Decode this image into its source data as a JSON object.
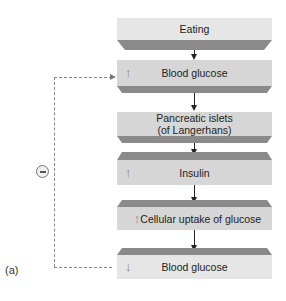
{
  "diagram": {
    "panel_label": "(a)",
    "feedback": {
      "sign": "−",
      "sign_icon": "minus-circle-icon",
      "from": "Blood glucose (decreased)",
      "to": "Blood glucose (increased)",
      "line_style": "dashed"
    },
    "steps": [
      {
        "label": "Eating",
        "indicator": ""
      },
      {
        "label": "Blood glucose",
        "indicator": "↑"
      },
      {
        "label": "Pancreatic islets\n(of Langerhans)",
        "label_line1": "Pancreatic islets",
        "label_line2": "(of Langerhans)",
        "indicator": ""
      },
      {
        "label": "Insulin",
        "indicator": "↑"
      },
      {
        "label": "Cellular uptake of glucose",
        "indicator": "↑"
      },
      {
        "label": "Blood glucose",
        "indicator": "↓"
      }
    ],
    "colors": {
      "box_face": "#d6d6d6",
      "box_face_light": "#e6e6e6",
      "bevel_dark": "#8a8a8a",
      "arrow": "#222222",
      "dashed_line": "#888888"
    }
  }
}
